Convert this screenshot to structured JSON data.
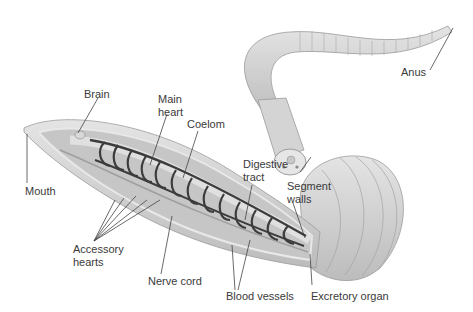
{
  "diagram": {
    "labels": {
      "brain": "Brain",
      "main_heart_1": "Main",
      "main_heart_2": "heart",
      "coelom": "Coelom",
      "mouth": "Mouth",
      "digestive_1": "Digestive",
      "digestive_2": "tract",
      "segment_1": "Segment",
      "segment_2": "walls",
      "anus": "Anus",
      "accessory_1": "Accessory",
      "accessory_2": "hearts",
      "nerve_cord": "Nerve cord",
      "blood_vessels": "Blood vessels",
      "excretory": "Excretory organ"
    },
    "colors": {
      "body": "#d6d6d6",
      "shade": "#b4b4b4",
      "vessel": "#3c3c3c",
      "label": "#3a3a3a",
      "leader": "#444444"
    }
  }
}
